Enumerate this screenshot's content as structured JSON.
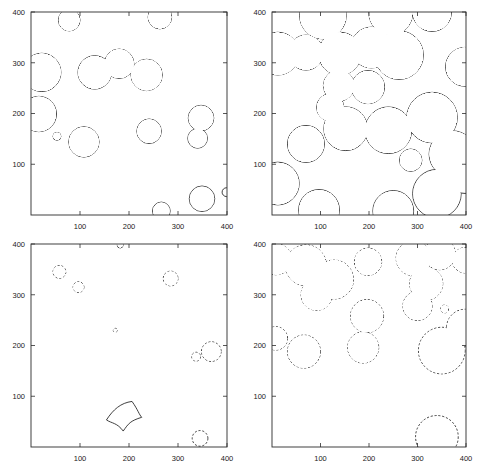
{
  "figure": {
    "kind": "four-panel-contour-figure",
    "background_color": "#ffffff",
    "line_color": "#1d1d1d",
    "panel_count": 4
  },
  "axes_common": {
    "xlim": [
      0,
      400
    ],
    "ylim": [
      0,
      400
    ],
    "xticks": [
      100,
      200,
      300,
      400
    ],
    "yticks": [
      100,
      200,
      300,
      400
    ],
    "xtick_labels": [
      "100",
      "200",
      "300",
      "400"
    ],
    "ytick_labels": [
      "100",
      "200",
      "300",
      "400"
    ],
    "grid": "off",
    "box": "on"
  },
  "chart_data": [
    {
      "type": "scatter",
      "panel": "top-left",
      "title": "",
      "xlabel": "",
      "ylabel": "",
      "xlim": [
        0,
        400
      ],
      "ylim": [
        0,
        400
      ],
      "xticks": [
        100,
        200,
        300,
        400
      ],
      "yticks": [
        100,
        200,
        300,
        400
      ],
      "grid": "off",
      "linestyle": "solid",
      "description": "Sparse, mostly non-overlapping circular contours",
      "shapes": [
        {
          "cx": 78,
          "cy": 384,
          "r": 22
        },
        {
          "cx": 263,
          "cy": 390,
          "r": 24
        },
        {
          "cx": 22,
          "cy": 281,
          "r": 39
        },
        {
          "cx": 130,
          "cy": 281,
          "r": 34
        },
        {
          "cx": 180,
          "cy": 298,
          "r": 30
        },
        {
          "cx": 236,
          "cy": 276,
          "r": 32
        },
        {
          "cx": 16,
          "cy": 199,
          "r": 36
        },
        {
          "cx": 53,
          "cy": 155,
          "r": 8
        },
        {
          "cx": 108,
          "cy": 144,
          "r": 31
        },
        {
          "cx": 241,
          "cy": 165,
          "r": 25
        },
        {
          "cx": 347,
          "cy": 191,
          "r": 26
        },
        {
          "cx": 340,
          "cy": 151,
          "r": 20
        },
        {
          "cx": 266,
          "cy": 8,
          "r": 18
        },
        {
          "cx": 349,
          "cy": 32,
          "r": 26
        },
        {
          "cx": 399,
          "cy": 45,
          "r": 9
        }
      ]
    },
    {
      "type": "scatter",
      "panel": "top-right",
      "title": "",
      "xlabel": "",
      "ylabel": "",
      "xlim": [
        0,
        400
      ],
      "ylim": [
        0,
        400
      ],
      "xticks": [
        100,
        200,
        300,
        400
      ],
      "yticks": [
        100,
        200,
        300,
        400
      ],
      "grid": "off",
      "linestyle": "solid",
      "description": "Dense, heavily overlapping circular contours forming merged blobs",
      "shapes": [
        {
          "cx": 105,
          "cy": 393,
          "r": 48
        },
        {
          "cx": 245,
          "cy": 398,
          "r": 45
        },
        {
          "cx": 330,
          "cy": 400,
          "r": 40
        },
        {
          "cx": 12,
          "cy": 318,
          "r": 44
        },
        {
          "cx": 70,
          "cy": 320,
          "r": 36
        },
        {
          "cx": 140,
          "cy": 318,
          "r": 44
        },
        {
          "cx": 205,
          "cy": 330,
          "r": 42
        },
        {
          "cx": 262,
          "cy": 315,
          "r": 50
        },
        {
          "cx": 296,
          "cy": 305,
          "r": 9
        },
        {
          "cx": 398,
          "cy": 292,
          "r": 40
        },
        {
          "cx": 138,
          "cy": 255,
          "r": 32
        },
        {
          "cx": 198,
          "cy": 252,
          "r": 34
        },
        {
          "cx": 120,
          "cy": 212,
          "r": 28
        },
        {
          "cx": 152,
          "cy": 170,
          "r": 45
        },
        {
          "cx": 240,
          "cy": 167,
          "r": 48
        },
        {
          "cx": 330,
          "cy": 192,
          "r": 52
        },
        {
          "cx": 70,
          "cy": 140,
          "r": 38
        },
        {
          "cx": 286,
          "cy": 108,
          "r": 23
        },
        {
          "cx": 372,
          "cy": 120,
          "r": 48
        },
        {
          "cx": 12,
          "cy": 62,
          "r": 44
        },
        {
          "cx": 97,
          "cy": 10,
          "r": 42
        },
        {
          "cx": 250,
          "cy": 8,
          "r": 42
        },
        {
          "cx": 340,
          "cy": 42,
          "r": 50
        },
        {
          "cx": 398,
          "cy": 75,
          "r": 34
        }
      ]
    },
    {
      "type": "scatter",
      "panel": "bottom-left",
      "title": "",
      "xlabel": "",
      "ylabel": "",
      "xlim": [
        0,
        400
      ],
      "ylim": [
        0,
        400
      ],
      "xticks": [
        100,
        200,
        300,
        400
      ],
      "yticks": [
        100,
        200,
        300,
        400
      ],
      "grid": "off",
      "linestyle": "dashed",
      "description": "Very sparse small dashed circular contours plus one solid curved-quadrilateral blob",
      "shapes": [
        {
          "cx": 182,
          "cy": 398,
          "r": 6,
          "style": "solid"
        },
        {
          "cx": 58,
          "cy": 345,
          "r": 13,
          "style": "dashed"
        },
        {
          "cx": 97,
          "cy": 315,
          "r": 11,
          "style": "dashed"
        },
        {
          "cx": 285,
          "cy": 332,
          "r": 15,
          "style": "dashed"
        },
        {
          "cx": 172,
          "cy": 230,
          "r": 4,
          "style": "dashed"
        },
        {
          "cx": 368,
          "cy": 188,
          "r": 20,
          "style": "dashed"
        },
        {
          "cx": 337,
          "cy": 178,
          "r": 9,
          "style": "dashed"
        },
        {
          "cx": 345,
          "cy": 17,
          "r": 16,
          "style": "dashed"
        },
        {
          "cx": 190,
          "cy": 62,
          "r": 36,
          "style": "solid",
          "shape": "astroid-blob"
        }
      ]
    },
    {
      "type": "scatter",
      "panel": "bottom-right",
      "title": "",
      "xlabel": "",
      "ylabel": "",
      "xlim": [
        0,
        400
      ],
      "ylim": [
        0,
        400
      ],
      "xticks": [
        100,
        200,
        300,
        400
      ],
      "yticks": [
        100,
        200,
        300,
        400
      ],
      "grid": "off",
      "linestyle": "dashed",
      "description": "Medium-sized dashed blobs, several merged pairs",
      "shapes": [
        {
          "cx": 8,
          "cy": 370,
          "r": 32
        },
        {
          "cx": 70,
          "cy": 358,
          "r": 42
        },
        {
          "cx": 128,
          "cy": 330,
          "r": 40
        },
        {
          "cx": 92,
          "cy": 300,
          "r": 32
        },
        {
          "cx": 198,
          "cy": 365,
          "r": 28
        },
        {
          "cx": 292,
          "cy": 372,
          "r": 36
        },
        {
          "cx": 346,
          "cy": 380,
          "r": 32
        },
        {
          "cx": 398,
          "cy": 368,
          "r": 26
        },
        {
          "cx": 318,
          "cy": 322,
          "r": 34
        },
        {
          "cx": 330,
          "cy": 325,
          "r": 10
        },
        {
          "cx": 300,
          "cy": 278,
          "r": 30
        },
        {
          "cx": 356,
          "cy": 272,
          "r": 8
        },
        {
          "cx": 196,
          "cy": 258,
          "r": 34
        },
        {
          "cx": 188,
          "cy": 196,
          "r": 32
        },
        {
          "cx": 8,
          "cy": 214,
          "r": 24
        },
        {
          "cx": 66,
          "cy": 188,
          "r": 34
        },
        {
          "cx": 398,
          "cy": 235,
          "r": 38
        },
        {
          "cx": 350,
          "cy": 190,
          "r": 48
        },
        {
          "cx": 340,
          "cy": 20,
          "r": 44
        }
      ]
    }
  ]
}
